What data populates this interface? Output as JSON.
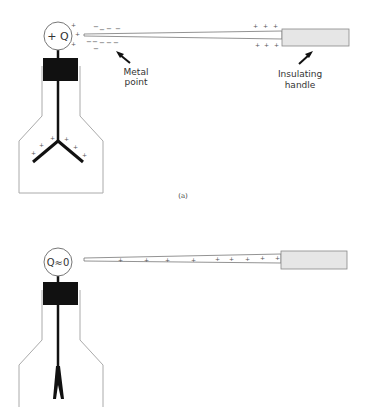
{
  "figure": {
    "panel_a": {
      "caption": "(a)",
      "sphere_label": "+ Q",
      "metal_point_label_line1": "Metal",
      "metal_point_label_line2": "point",
      "handle_label_line1": "Insulating",
      "handle_label_line2": "handle",
      "sphere_charges": [
        "+",
        "+",
        "+"
      ],
      "induced_negative_charges": [
        "−",
        "−",
        "−",
        "−",
        "−",
        "−",
        "−",
        "−",
        "−",
        "−"
      ],
      "rod_positive_charges_top": [
        "+",
        "+",
        "+"
      ],
      "rod_positive_charges_bottom": [
        "+",
        "+",
        "+"
      ],
      "leaf_charges": [
        "+",
        "+",
        "+",
        "+",
        "+",
        "+"
      ],
      "leaves_state": "diverged"
    },
    "panel_b": {
      "sphere_label": "Q≈0",
      "rod_positive_charges": [
        "+",
        "+",
        "+",
        "+",
        "+",
        "+",
        "+"
      ],
      "leaves_state": "collapsed"
    },
    "colors": {
      "line": "#333333",
      "block": "#111111",
      "handle_fill": "#e6e6e6",
      "outline": "#999999"
    }
  }
}
